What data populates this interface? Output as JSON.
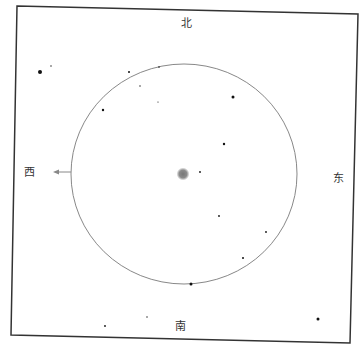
{
  "directions": {
    "north": {
      "label": "北",
      "x": 186,
      "y": 23
    },
    "south": {
      "label": "南",
      "x": 180,
      "y": 326
    },
    "east": {
      "label": "东",
      "x": 338,
      "y": 178
    },
    "west": {
      "label": "西",
      "x": 29,
      "y": 172
    }
  },
  "frame": {
    "points": "17,6 358,14 350,343 11,335",
    "stroke": "#333333"
  },
  "field_circle": {
    "cx": 184,
    "cy": 174,
    "rx": 113,
    "ry": 110,
    "stroke": "#888888"
  },
  "west_arrow": {
    "x1": 71,
    "y1": 172,
    "x2": 53,
    "y2": 172,
    "color": "#888888"
  },
  "center_object": {
    "cx": 183,
    "cy": 174,
    "r": 5,
    "color": "#777777"
  },
  "stars": [
    {
      "x": 40,
      "y": 72,
      "r": 2.0
    },
    {
      "x": 51,
      "y": 66,
      "r": 0.7
    },
    {
      "x": 129,
      "y": 72,
      "r": 1.0
    },
    {
      "x": 140,
      "y": 86,
      "r": 0.7
    },
    {
      "x": 159,
      "y": 67,
      "r": 0.8
    },
    {
      "x": 158,
      "y": 102,
      "r": 0.6
    },
    {
      "x": 103,
      "y": 110,
      "r": 1.2
    },
    {
      "x": 233,
      "y": 97,
      "r": 1.5
    },
    {
      "x": 224,
      "y": 144,
      "r": 1.2
    },
    {
      "x": 200,
      "y": 172,
      "r": 0.9
    },
    {
      "x": 219,
      "y": 216,
      "r": 0.9
    },
    {
      "x": 266,
      "y": 232,
      "r": 0.9
    },
    {
      "x": 243,
      "y": 258,
      "r": 1.0
    },
    {
      "x": 191,
      "y": 284,
      "r": 1.5
    },
    {
      "x": 105,
      "y": 326,
      "r": 0.9
    },
    {
      "x": 147,
      "y": 317,
      "r": 0.7
    },
    {
      "x": 318,
      "y": 319,
      "r": 1.5
    }
  ]
}
